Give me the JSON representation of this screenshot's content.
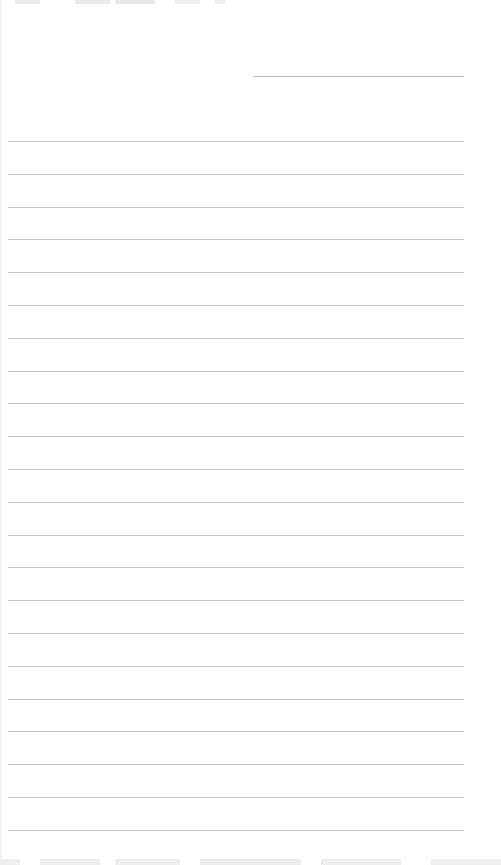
{
  "page": {
    "type": "lined-paper",
    "background_color": "#ffffff",
    "line_color": "#c4c4c4"
  },
  "header_line": {
    "top": 76,
    "left": 253,
    "width": 211
  },
  "ruled_lines": {
    "first_top": 141,
    "spacing": 32.8,
    "count": 22,
    "left": 8,
    "width": 456
  }
}
